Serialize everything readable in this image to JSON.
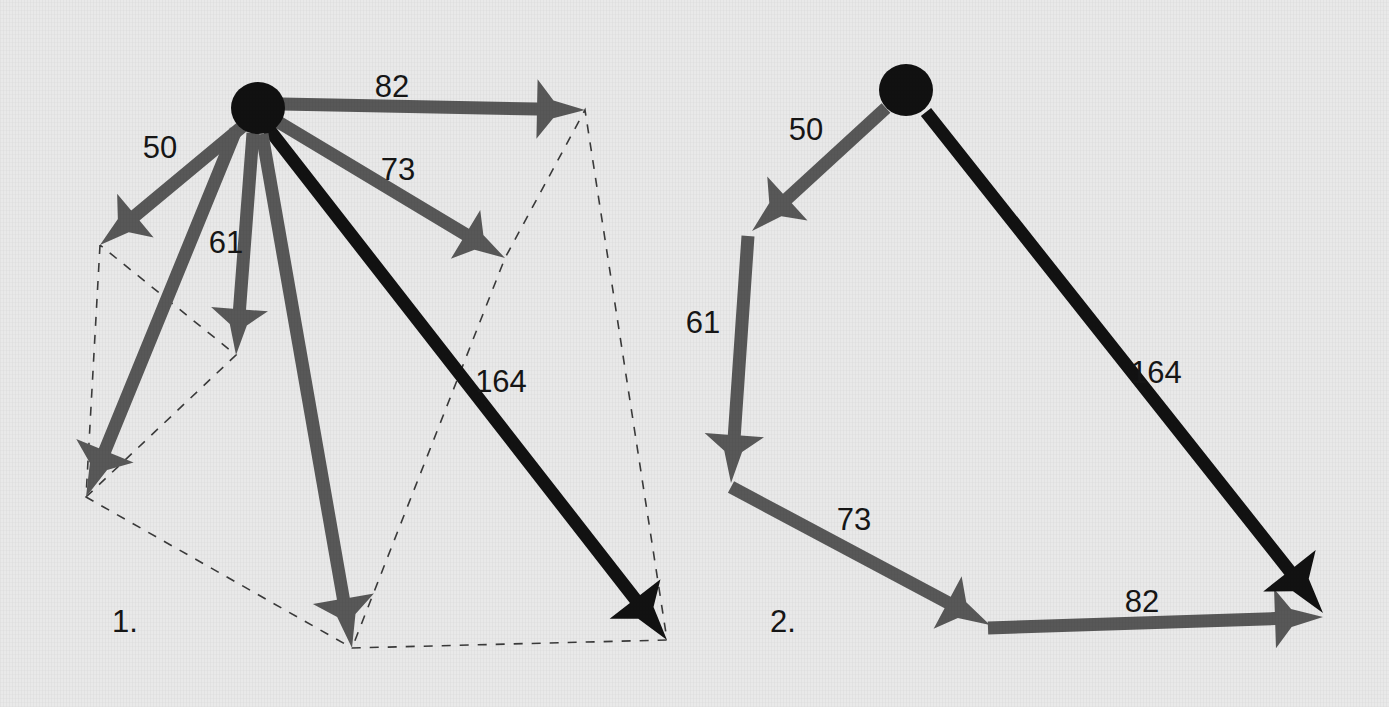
{
  "figure": {
    "background_color": "#e9e9e9",
    "arrow_gray": "#585858",
    "arrow_black": "#121212",
    "node_color": "#111111",
    "dashed_color": "#3a3a3a",
    "label_color": "#161616"
  },
  "panels": [
    {
      "id": "panel-1",
      "caption": "1.",
      "caption_x": 112,
      "caption_y": 632,
      "node": {
        "cx": 258,
        "cy": 108,
        "rx": 27,
        "ry": 26
      },
      "vectors": [
        {
          "name": "vector-82",
          "label": "82",
          "value": 82,
          "color": "#585858",
          "x1": 282,
          "y1": 104,
          "x2": 585,
          "y2": 110,
          "label_x": 392,
          "label_y": 97,
          "head": 48,
          "shaft": 13
        },
        {
          "name": "vector-73",
          "label": "73",
          "value": 73,
          "color": "#585858",
          "x1": 275,
          "y1": 120,
          "x2": 505,
          "y2": 258,
          "label_x": 398,
          "label_y": 180,
          "head": 46,
          "shaft": 13
        },
        {
          "name": "vector-164",
          "label": "164",
          "value": 164,
          "color": "#121212",
          "x1": 268,
          "y1": 128,
          "x2": 667,
          "y2": 640,
          "label_x": 501,
          "label_y": 392,
          "head": 52,
          "shaft": 13
        },
        {
          "name": "vector-50",
          "label": "50",
          "value": 50,
          "color": "#585858",
          "x1": 243,
          "y1": 126,
          "x2": 100,
          "y2": 245,
          "label_x": 160,
          "label_y": 158,
          "head": 46,
          "shaft": 13
        },
        {
          "name": "vector-61",
          "label": "61",
          "value": 61,
          "color": "#585858",
          "x1": 253,
          "y1": 133,
          "x2": 236,
          "y2": 355,
          "label_x": 226,
          "label_y": 253,
          "head": 46,
          "shaft": 13
        },
        {
          "name": "vector-resultant-left",
          "label": "",
          "value": null,
          "color": "#585858",
          "x1": 236,
          "y1": 130,
          "x2": 86,
          "y2": 497,
          "label_x": 0,
          "label_y": 0,
          "head": 50,
          "shaft": 13
        },
        {
          "name": "vector-resultant-down",
          "label": "",
          "value": null,
          "color": "#585858",
          "x1": 262,
          "y1": 134,
          "x2": 352,
          "y2": 648,
          "label_x": 0,
          "label_y": 0,
          "head": 50,
          "shaft": 13
        }
      ],
      "dashed_path": "M 100,245 L 86,497 L 352,648 L 667,640 L 585,110 L 505,258 L 352,648 M 86,497 L 236,355 L 100,245"
    },
    {
      "id": "panel-2",
      "caption": "2.",
      "caption_x": 770,
      "caption_y": 632,
      "node": {
        "cx": 906,
        "cy": 90,
        "rx": 27,
        "ry": 26
      },
      "vectors": [
        {
          "name": "vector-50",
          "label": "50",
          "value": 50,
          "color": "#585858",
          "x1": 886,
          "y1": 108,
          "x2": 752,
          "y2": 231,
          "label_x": 806,
          "label_y": 140,
          "head": 48,
          "shaft": 13
        },
        {
          "name": "vector-61",
          "label": "61",
          "value": 61,
          "color": "#585858",
          "x1": 748,
          "y1": 236,
          "x2": 731,
          "y2": 483,
          "label_x": 703,
          "label_y": 333,
          "head": 48,
          "shaft": 13
        },
        {
          "name": "vector-73",
          "label": "73",
          "value": 73,
          "color": "#585858",
          "x1": 731,
          "y1": 487,
          "x2": 990,
          "y2": 625,
          "label_x": 854,
          "label_y": 530,
          "head": 48,
          "shaft": 13
        },
        {
          "name": "vector-82",
          "label": "82",
          "value": 82,
          "color": "#585858",
          "x1": 988,
          "y1": 628,
          "x2": 1323,
          "y2": 617,
          "label_x": 1142,
          "label_y": 612,
          "head": 48,
          "shaft": 13
        },
        {
          "name": "vector-164",
          "label": "164",
          "value": 164,
          "color": "#121212",
          "x1": 926,
          "y1": 112,
          "x2": 1323,
          "y2": 613,
          "label_x": 1156,
          "label_y": 383,
          "head": 54,
          "shaft": 13
        }
      ],
      "dashed_path": ""
    }
  ]
}
